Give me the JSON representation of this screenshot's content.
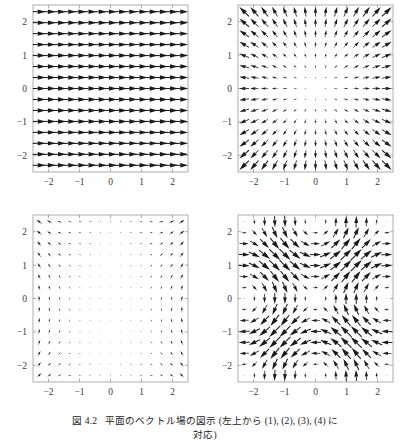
{
  "figure": {
    "label": "図",
    "number": "4.2",
    "caption_main": "平面のベクトル場の図示 (左上から (1), (2), (3), (4) に",
    "caption_cont": "対応)",
    "caption_full": "図 4.2　平面のベクトル場の図示 (左上から (1), (2), (3), (4) に対応)",
    "background_color": "#ffffff",
    "arrow_color": "#1a1a1a",
    "frame_color": "#8c8c8c",
    "tick_label_color": "#3a3a3a"
  },
  "axes_common": {
    "xlim": [
      -2.5,
      2.5
    ],
    "ylim": [
      -2.5,
      2.5
    ],
    "xticks": [
      -2,
      -1,
      0,
      1,
      2
    ],
    "yticks": [
      -2,
      -1,
      0,
      1,
      2
    ],
    "xtick_labels": [
      "−2",
      "−1",
      "0",
      "1",
      "2"
    ],
    "ytick_labels": [
      "−2",
      "−1",
      "0",
      "1",
      "2"
    ],
    "grid": false,
    "legend": false,
    "title": ""
  },
  "chart_data": [
    {
      "id": "panel-1",
      "position": "top-left",
      "panel_index": 1,
      "type": "quiver",
      "title": "",
      "xlabel": "",
      "ylabel": "",
      "xlim": [
        -2.5,
        2.5
      ],
      "ylim": [
        -2.5,
        2.5
      ],
      "xticks": [
        -2,
        -1,
        0,
        1,
        2
      ],
      "yticks": [
        -2,
        -1,
        0,
        1,
        2
      ],
      "xtick_labels": [
        "−2",
        "−1",
        "0",
        "1",
        "2"
      ],
      "ytick_labels": [
        "−2",
        "−1",
        "0",
        "1",
        "2"
      ],
      "grid": false,
      "legend": false,
      "field_description": "uniform constant field pointing in +x direction",
      "field_formula": "F(x,y) = (1, 0)",
      "field": "uniform_x",
      "nx": 15,
      "ny": 15,
      "sample_min": -2.3,
      "sample_max": 2.3,
      "arrow_scale": 1.0,
      "uniform_length": true
    },
    {
      "id": "panel-2",
      "position": "top-right",
      "panel_index": 2,
      "type": "quiver",
      "title": "",
      "xlabel": "",
      "ylabel": "",
      "xlim": [
        -2.5,
        2.5
      ],
      "ylim": [
        -2.5,
        2.5
      ],
      "xticks": [
        -2,
        -1,
        0,
        1,
        2
      ],
      "yticks": [
        -2,
        -1,
        0,
        1,
        2
      ],
      "xtick_labels": [
        "−2",
        "−1",
        "0",
        "1",
        "2"
      ],
      "ytick_labels": [
        "−2",
        "−1",
        "0",
        "1",
        "2"
      ],
      "grid": false,
      "legend": false,
      "field_description": "radial source field pointing outward from the origin, magnitude growing with distance",
      "field_formula": "F(x,y) = (x, y)",
      "field": "radial",
      "nx": 15,
      "ny": 15,
      "sample_min": -2.3,
      "sample_max": 2.3,
      "arrow_scale": 0.62,
      "uniform_length": false
    },
    {
      "id": "panel-3",
      "position": "bottom-left",
      "panel_index": 3,
      "type": "quiver",
      "title": "",
      "xlabel": "",
      "ylabel": "",
      "xlim": [
        -2.5,
        2.5
      ],
      "ylim": [
        -2.5,
        2.5
      ],
      "xticks": [
        -2,
        -1,
        0,
        1,
        2
      ],
      "yticks": [
        -2,
        -1,
        0,
        1,
        2
      ],
      "xtick_labels": [
        "−2",
        "−1",
        "0",
        "1",
        "2"
      ],
      "ytick_labels": [
        "−2",
        "−1",
        "0",
        "1",
        "2"
      ],
      "grid": false,
      "legend": false,
      "field_description": "saddle-type field vanishing at the origin, arrows sweeping up-right in the upper half and down-right toward the lower-right corner",
      "field_formula": "F(x,y) = (x·y, x² ) style quadrupole / saddle pattern",
      "field": "saddle",
      "nx": 15,
      "ny": 15,
      "sample_min": -2.3,
      "sample_max": 2.3,
      "arrow_scale": 0.3,
      "uniform_length": false
    },
    {
      "id": "panel-4",
      "position": "bottom-right",
      "panel_index": 4,
      "type": "quiver",
      "title": "",
      "xlabel": "",
      "ylabel": "",
      "xlim": [
        -2.5,
        2.5
      ],
      "ylim": [
        -2.5,
        2.5
      ],
      "xticks": [
        -2,
        -1,
        0,
        1,
        2
      ],
      "yticks": [
        -2,
        -1,
        0,
        1,
        2
      ],
      "xtick_labels": [
        "−2",
        "−1",
        "0",
        "1",
        "2"
      ],
      "ytick_labels": [
        "−2",
        "−1",
        "0",
        "1",
        "2"
      ],
      "grid": false,
      "legend": false,
      "field_description": "periodic swirling field with several rotation centres (vortex lattice)",
      "field_formula": "F(x,y) = (sin y, sin x)",
      "field": "vortex_lattice",
      "nx": 15,
      "ny": 15,
      "sample_min": -2.3,
      "sample_max": 2.3,
      "arrow_scale": 0.72,
      "uniform_length": false
    }
  ]
}
